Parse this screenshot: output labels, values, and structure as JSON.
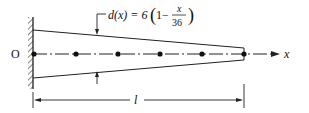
{
  "diagram": {
    "origin_label": "O",
    "axis_label": "x",
    "length_label": "l",
    "formula": {
      "lhs": "d(x) = 6",
      "inner_prefix": "1−",
      "numerator": "x",
      "denominator": "36"
    },
    "node_count": 6
  }
}
